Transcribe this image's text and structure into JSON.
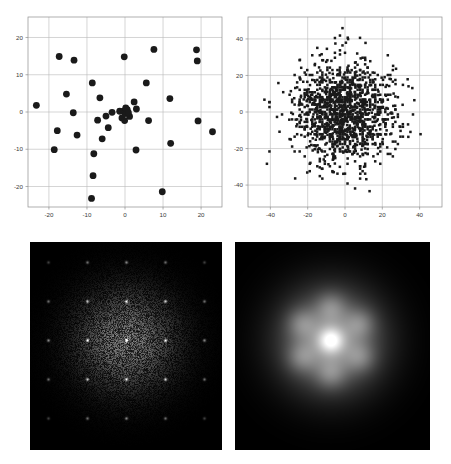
{
  "figure": {
    "title": "",
    "layout": "2x2 panel grid",
    "background_color": "#ffffff",
    "panels": [
      {
        "name": "sparse-point-set-scatter",
        "position": "top-left"
      },
      {
        "name": "dense-point-set-scatter",
        "position": "top-right"
      },
      {
        "name": "speckled-diffraction-pattern",
        "position": "bottom-left"
      },
      {
        "name": "smooth-diffraction-pattern",
        "position": "bottom-right"
      }
    ]
  },
  "chart_data": [
    {
      "type": "scatter",
      "name": "sparse-point-set-scatter",
      "position": "top-left",
      "title": "",
      "xlabel": "",
      "ylabel": "",
      "xlim": [
        -25.5,
        25.5
      ],
      "ylim": [
        -25.5,
        25.5
      ],
      "xticks": [
        -20,
        -10,
        0,
        10,
        20
      ],
      "xticklabels": [
        "-20",
        "-10",
        "0",
        "10",
        "20"
      ],
      "yticks": [
        -20,
        -10,
        0,
        10,
        20
      ],
      "yticklabels": [
        "-20",
        "-10",
        "0",
        "10",
        "20"
      ],
      "grid": true,
      "legend": "none",
      "marker": {
        "shape": "circle",
        "color": "#1a1a1a",
        "size": 3.4
      },
      "n_points": 42,
      "points": [
        [
          -23.3,
          1.8
        ],
        [
          -17.3,
          14.9
        ],
        [
          -17.8,
          -5.0
        ],
        [
          -18.6,
          -10.1
        ],
        [
          -13.4,
          13.9
        ],
        [
          -15.4,
          4.8
        ],
        [
          -12.6,
          -6.2
        ],
        [
          -13.6,
          -0.2
        ],
        [
          -8.2,
          -11.2
        ],
        [
          -8.6,
          7.8
        ],
        [
          -8.4,
          -17.1
        ],
        [
          -8.8,
          -23.2
        ],
        [
          -7.2,
          -2.2
        ],
        [
          -6.6,
          3.8
        ],
        [
          -6.0,
          -7.2
        ],
        [
          -5.0,
          -1.1
        ],
        [
          -4.4,
          -4.2
        ],
        [
          -0.2,
          14.8
        ],
        [
          -0.3,
          0.3
        ],
        [
          0.4,
          0.1
        ],
        [
          0.0,
          -0.4
        ],
        [
          2.4,
          2.7
        ],
        [
          2.9,
          -10.2
        ],
        [
          3.0,
          0.8
        ],
        [
          5.6,
          7.8
        ],
        [
          6.2,
          -2.3
        ],
        [
          7.6,
          16.8
        ],
        [
          9.8,
          -21.4
        ],
        [
          11.8,
          3.6
        ],
        [
          12.0,
          -8.4
        ],
        [
          18.8,
          16.7
        ],
        [
          19.0,
          13.7
        ],
        [
          19.2,
          -2.4
        ],
        [
          23.0,
          -5.3
        ],
        [
          -3.4,
          -0.1
        ],
        [
          0.6,
          0.6
        ],
        [
          1.2,
          -1.2
        ],
        [
          -1.4,
          0.2
        ],
        [
          0.2,
          1.1
        ],
        [
          -0.8,
          -1.6
        ],
        [
          0.9,
          -0.2
        ],
        [
          -0.1,
          -2.3
        ]
      ]
    },
    {
      "type": "scatter",
      "name": "dense-point-set-scatter",
      "position": "top-right",
      "title": "",
      "xlabel": "",
      "ylabel": "",
      "xlim": [
        -52,
        52
      ],
      "ylim": [
        -52,
        52
      ],
      "xticks": [
        -40,
        -20,
        0,
        20,
        40
      ],
      "xticklabels": [
        "-40",
        "-20",
        "0",
        "20",
        "40"
      ],
      "yticks": [
        -40,
        -20,
        0,
        20,
        40
      ],
      "yticklabels": [
        "-40",
        "-20",
        "0",
        "20",
        "40"
      ],
      "grid": true,
      "legend": "none",
      "marker": {
        "shape": "circle",
        "color": "#1a1a1a",
        "size": 1.25
      },
      "n_points": 1400,
      "distribution": "2D gaussian cloud centered at origin, sigma approx 13, with dense square-lattice-like core",
      "seed": 7
    },
    {
      "type": "heatmap",
      "name": "speckled-diffraction-pattern",
      "position": "bottom-left",
      "title": "",
      "colormap": "gray",
      "background_color": "#000000",
      "description": "Speckled bright disc on black background with a square lattice of bright Bragg peaks",
      "lattice_spacing_px": 39,
      "disc_radius_px": 52,
      "peak_color": "#ffffff",
      "halo_color": "#9a9a9a"
    },
    {
      "type": "heatmap",
      "name": "smooth-diffraction-pattern",
      "position": "bottom-right",
      "title": "",
      "colormap": "gray",
      "background_color": "#000000",
      "description": "Smooth bright blob on black background with one central peak and six hexagonally arranged satellite spots",
      "satellite_count": 6,
      "satellite_radius_px": 34,
      "blob_radius_px": 64,
      "peak_color": "#ffffff",
      "halo_color": "#b4b4b4"
    }
  ]
}
